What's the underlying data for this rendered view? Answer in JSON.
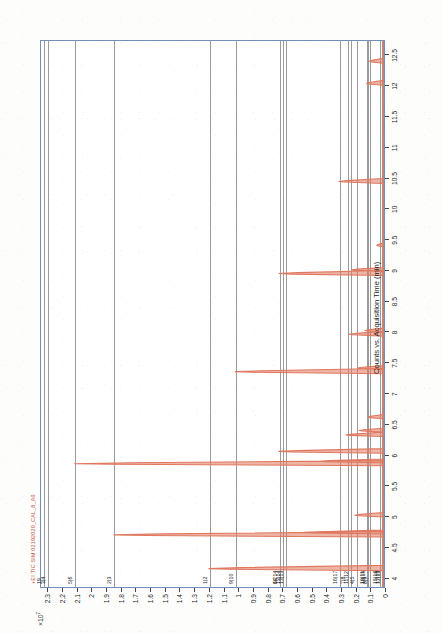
{
  "series_title": "+EI TIC SIM 02192020_CAL_8_A0",
  "series_color": "#e0785f",
  "plot_border_color": "#6f8fb5",
  "gridline_color": "#9a9a9a",
  "axes": {
    "x_title": "Counts vs. Acquisition Time (min)",
    "x_ticks": [
      "4",
      "4.5",
      "5",
      "5.5",
      "6",
      "6.5",
      "7",
      "7.5",
      "8",
      "8.5",
      "9",
      "9.5",
      "10",
      "10.5",
      "11",
      "11.5",
      "12",
      "12.5"
    ],
    "x_min": 3.85,
    "x_max": 12.75,
    "y_exponent_label": "×10",
    "y_exponent_sup": "7",
    "y_ticks": [
      "2.3",
      "2.2",
      "2.1",
      "2",
      "1.9",
      "1.8",
      "1.7",
      "1.6",
      "1.5",
      "1.4",
      "1.3",
      "1.2",
      "1.1",
      "1",
      "0.9",
      "0.8",
      "0.7",
      "0.6",
      "0.5",
      "0.4",
      "0.3",
      "0.2",
      "0.1",
      "0"
    ],
    "y_min": 0,
    "y_max": 2.35
  },
  "peak_group_labels": [
    {
      "text": "1|2",
      "y": 1.2
    },
    {
      "text": "2|3",
      "y": 1.85
    },
    {
      "text": "3|4",
      "y": 2.3
    },
    {
      "text": "4|5",
      "y": 0.2
    },
    {
      "text": "5|6",
      "y": 2.12
    },
    {
      "text": "6|7",
      "y": 0.72
    },
    {
      "text": "7|8",
      "y": 0.26
    },
    {
      "text": "8|9",
      "y": 0.11
    },
    {
      "text": "9|10",
      "y": 1.02
    },
    {
      "text": "10|11",
      "y": 0.13
    },
    {
      "text": "11|12",
      "y": 0.24
    },
    {
      "text": "12|13",
      "y": 0.02
    },
    {
      "text": "13|13",
      "y": 0.68
    },
    {
      "text": "14 14",
      "y": 0.72
    },
    {
      "text": "13|14",
      "y": 0.7
    },
    {
      "text": "15|16",
      "y": 0.04
    },
    {
      "text": "16|17",
      "y": 0.31
    },
    {
      "text": "17|18",
      "y": 0.03
    },
    {
      "text": "18|19",
      "y": 0.12
    },
    {
      "text": "19",
      "y": 2.33
    }
  ],
  "chart_data": {
    "type": "line",
    "title": "+EI TIC SIM 02192020_CAL_8_A0",
    "subtitle": "",
    "xlabel": "Counts vs. Acquisition Time (min)",
    "ylabel": "Counts (×10⁷)",
    "xlim": [
      3.85,
      12.75
    ],
    "ylim": [
      0,
      2.35
    ],
    "grid": true,
    "legend": "none",
    "orientation": "rotated-90",
    "peaks": [
      {
        "id": 1,
        "rt": 4.15,
        "height": 1.2,
        "width": 0.035,
        "label": "1|2"
      },
      {
        "id": 2,
        "rt": 4.7,
        "height": 1.85,
        "width": 0.035,
        "label": "2|3"
      },
      {
        "id": 3,
        "rt": 4.74,
        "height": 0.55,
        "width": 0.025,
        "label": "3|4"
      },
      {
        "id": 4,
        "rt": 5.02,
        "height": 0.2,
        "width": 0.03,
        "label": "4|5"
      },
      {
        "id": 5,
        "rt": 5.86,
        "height": 2.12,
        "width": 0.033,
        "label": "5|6"
      },
      {
        "id": 6,
        "rt": 5.9,
        "height": 0.45,
        "width": 0.025,
        "label": "5|6b"
      },
      {
        "id": 7,
        "rt": 6.06,
        "height": 0.72,
        "width": 0.03,
        "label": "6|7"
      },
      {
        "id": 8,
        "rt": 6.33,
        "height": 0.26,
        "width": 0.028,
        "label": "7|8"
      },
      {
        "id": 9,
        "rt": 6.4,
        "height": 0.17,
        "width": 0.026,
        "label": "7|8b"
      },
      {
        "id": 10,
        "rt": 6.62,
        "height": 0.11,
        "width": 0.028,
        "label": "8|9"
      },
      {
        "id": 11,
        "rt": 7.36,
        "height": 1.02,
        "width": 0.034,
        "label": "9|10"
      },
      {
        "id": 12,
        "rt": 7.42,
        "height": 0.18,
        "width": 0.026,
        "label": "9|10b"
      },
      {
        "id": 13,
        "rt": 7.97,
        "height": 0.24,
        "width": 0.03,
        "label": "11|12"
      },
      {
        "id": 14,
        "rt": 8.03,
        "height": 0.13,
        "width": 0.026,
        "label": "10|11"
      },
      {
        "id": 15,
        "rt": 8.96,
        "height": 0.72,
        "width": 0.032,
        "label": "13|14"
      },
      {
        "id": 16,
        "rt": 9.02,
        "height": 0.22,
        "width": 0.026,
        "label": "14|14"
      },
      {
        "id": 17,
        "rt": 9.42,
        "height": 0.05,
        "width": 0.024,
        "label": "15|16"
      },
      {
        "id": 18,
        "rt": 10.46,
        "height": 0.31,
        "width": 0.032,
        "label": "16|17"
      },
      {
        "id": 19,
        "rt": 12.06,
        "height": 0.12,
        "width": 0.032,
        "label": "18|19"
      },
      {
        "id": 20,
        "rt": 12.42,
        "height": 0.1,
        "width": 0.032,
        "label": "19"
      }
    ],
    "gridlines_at_y": [
      1.2,
      1.85,
      2.3,
      0.2,
      2.12,
      0.72,
      0.26,
      0.11,
      1.02,
      0.13,
      0.24,
      0.02,
      0.68,
      0.72,
      0.7,
      0.04,
      0.31,
      0.03,
      0.12,
      2.33
    ]
  }
}
